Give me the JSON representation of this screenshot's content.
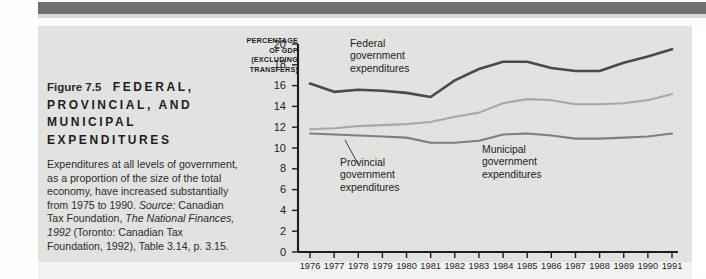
{
  "figure": {
    "number": "Figure 7.5",
    "title_lines": [
      "FEDERAL,",
      "PROVINCIAL, AND",
      "MUNICIPAL",
      "EXPENDITURES"
    ],
    "caption_parts": {
      "lead": "Expenditures at all levels of government, as a proportion of the size of the total economy, have increased substantially from 1975 to 1990. ",
      "source_label": "Source:",
      "source_pre": " Canadian Tax Foundation, ",
      "source_italic": "The National Finances, 1992",
      "source_post": " (Toronto: Canadian Tax Foundation, 1992), Table 3.14, p. 3.15."
    }
  },
  "colors": {
    "page_background": "#fdfdfd",
    "panel_background": "#e2e2e0",
    "top_band": "#6f7073",
    "federal_line": "#4a4a4c",
    "provincial_line": "#a8a8a6",
    "municipal_line": "#7e7e7e",
    "axis": "#1c1c1c",
    "text": "#1d1d1d"
  },
  "chart_data": {
    "type": "line",
    "title": "",
    "subtitle": "",
    "xlabel": "",
    "ylabel": "PERCENTAGE OF GDP (EXCLUDING TRANSFERS)",
    "ylabel_lines": [
      "PERCENTAGE",
      "OF GDP",
      "(EXCLUDING",
      "TRANSFERS)"
    ],
    "grid": false,
    "legend_position": "inline-annotations",
    "ylim": [
      0,
      20
    ],
    "yticks": [
      0,
      2,
      4,
      6,
      8,
      10,
      12,
      14,
      16,
      18,
      20
    ],
    "ytick_labels": [
      "0",
      "2",
      "4",
      "6",
      "8",
      "10",
      "12",
      "14",
      "16",
      "18",
      "20"
    ],
    "categories": [
      "1976",
      "1977",
      "1978",
      "1979",
      "1980",
      "1981",
      "1982",
      "1983",
      "1984",
      "1985",
      "1986",
      "1987",
      "1988",
      "1989",
      "1990",
      "1991"
    ],
    "x": [
      1976,
      1977,
      1978,
      1979,
      1980,
      1981,
      1982,
      1983,
      1984,
      1985,
      1986,
      1987,
      1988,
      1989,
      1990,
      1991
    ],
    "series": [
      {
        "name": "Federal government expenditures",
        "color": "#4a4a4c",
        "values": [
          16.2,
          15.4,
          15.6,
          15.5,
          15.3,
          14.9,
          16.5,
          17.6,
          18.3,
          18.3,
          17.7,
          17.4,
          17.4,
          18.2,
          18.8,
          19.5
        ]
      },
      {
        "name": "Provincial government expenditures",
        "color": "#a8a8a6",
        "values": [
          11.8,
          11.9,
          12.1,
          12.2,
          12.3,
          12.5,
          13.0,
          13.4,
          14.3,
          14.7,
          14.6,
          14.2,
          14.2,
          14.3,
          14.6,
          15.2
        ]
      },
      {
        "name": "Municipal government expenditures",
        "color": "#7e7e7e",
        "values": [
          11.4,
          11.3,
          11.2,
          11.1,
          11.0,
          10.5,
          10.5,
          10.7,
          11.3,
          11.4,
          11.2,
          10.9,
          10.9,
          11.0,
          11.1,
          11.4
        ]
      }
    ],
    "annotations": [
      {
        "name": "federal-annotation",
        "text_lines": [
          "Federal",
          "government",
          "expenditures"
        ]
      },
      {
        "name": "provincial-annotation",
        "text_lines": [
          "Provincial",
          "government",
          "expenditures"
        ],
        "leader_line": true
      },
      {
        "name": "municipal-annotation",
        "text_lines": [
          "Municipal",
          "government",
          "expenditures"
        ]
      }
    ]
  }
}
